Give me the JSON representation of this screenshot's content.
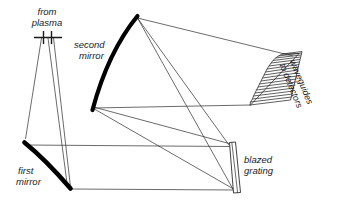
{
  "diagram": {
    "background_color": "#ffffff",
    "ink_color": "#1a1a1a",
    "ray_color": "#2b2b2b",
    "labels": {
      "source": {
        "line1": "from",
        "line2": "plasma"
      },
      "second_mirror": {
        "line1": "second",
        "line2": "mirror"
      },
      "first_mirror": {
        "line1": "first",
        "line2": "mirror"
      },
      "grating": {
        "line1": "blazed",
        "line2": "grating"
      },
      "waveguides": {
        "line1": "waveguides",
        "line2": "to detectors"
      }
    },
    "components": [
      {
        "name": "entrance-slit",
        "label": "from plasma",
        "x": 47,
        "y": 33
      },
      {
        "name": "first-mirror",
        "label": "first mirror",
        "x": 47,
        "y": 160
      },
      {
        "name": "second-mirror",
        "label": "second mirror",
        "x": 122,
        "y": 58
      },
      {
        "name": "blazed-grating",
        "label": "blazed grating",
        "x": 229,
        "y": 160
      },
      {
        "name": "waveguide-array",
        "label": "waveguides to detectors",
        "x": 288,
        "y": 82
      }
    ],
    "waveguide_count": 19,
    "ray_paths": [
      "slit-to-first-mirror-upper",
      "slit-to-first-mirror-lower",
      "first-mirror-to-grating-upper",
      "first-mirror-to-grating-lower",
      "grating-to-second-mirror-upper",
      "grating-to-second-mirror-lower",
      "second-mirror-to-waveguides-upper",
      "second-mirror-to-waveguides-lower"
    ]
  }
}
